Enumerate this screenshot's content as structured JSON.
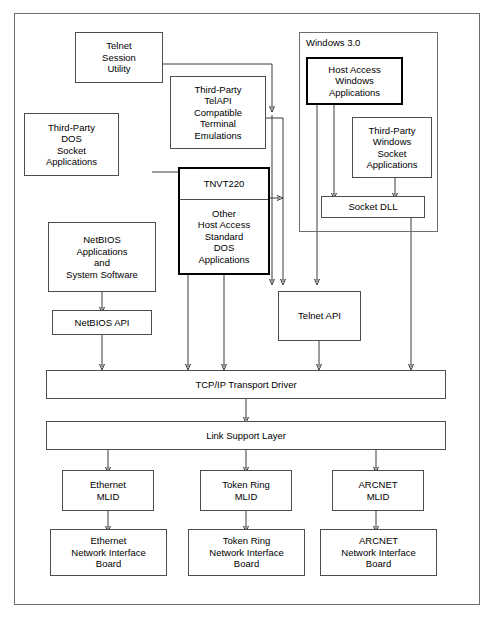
{
  "diagram": {
    "outer_frame": {
      "name": "diagram-border"
    },
    "groups": [
      {
        "id": "windows30",
        "label": "Windows 3.0"
      }
    ],
    "boxes": {
      "telnet_session_utility": {
        "lines": [
          "Telnet",
          "Session",
          "Utility"
        ]
      },
      "third_party_dos_socket": {
        "lines": [
          "Third-Party",
          "DOS",
          "Socket",
          "Applications"
        ]
      },
      "third_party_telapi": {
        "lines": [
          "Third-Party",
          "TelAPI",
          "Compatible",
          "Terminal",
          "Emulations"
        ]
      },
      "tnvt220": {
        "lines": [
          "TNVT220"
        ]
      },
      "other_host_access_dos": {
        "lines": [
          "Other",
          "Host Access",
          "Standard",
          "DOS",
          "Applications"
        ]
      },
      "netbios_applications": {
        "lines": [
          "NetBIOS",
          "Applications",
          "and",
          "System Software"
        ]
      },
      "netbios_api": {
        "lines": [
          "NetBIOS  API"
        ]
      },
      "telnet_api": {
        "lines": [
          "Telnet  API"
        ]
      },
      "host_access_windows": {
        "lines": [
          "Host Access",
          "Windows",
          "Applications"
        ]
      },
      "third_party_windows_socket": {
        "lines": [
          "Third-Party",
          "Windows",
          "Socket",
          "Applications"
        ]
      },
      "socket_dll": {
        "lines": [
          "Socket  DLL"
        ]
      },
      "tcpip_transport_driver": {
        "lines": [
          "TCP/IP Transport Driver"
        ]
      },
      "link_support_layer": {
        "lines": [
          "Link Support Layer"
        ]
      },
      "ethernet_mlid": {
        "lines": [
          "Ethernet",
          "MLID"
        ]
      },
      "token_ring_mlid": {
        "lines": [
          "Token Ring",
          "MLID"
        ]
      },
      "arcnet_mlid": {
        "lines": [
          "ARCNET",
          "MLID"
        ]
      },
      "ethernet_nib": {
        "lines": [
          "Ethernet",
          "Network Interface",
          "Board"
        ]
      },
      "token_ring_nib": {
        "lines": [
          "Token Ring",
          "Network Interface",
          "Board"
        ]
      },
      "arcnet_nib": {
        "lines": [
          "ARCNET",
          "Network Interface",
          "Board"
        ]
      }
    },
    "colors": {
      "line": "#3a3a3a",
      "box_border": "#4d4d4d",
      "thick_border": "#000000",
      "frame_border": "#6e6e6e",
      "text": "#000000",
      "background": "#ffffff"
    }
  }
}
